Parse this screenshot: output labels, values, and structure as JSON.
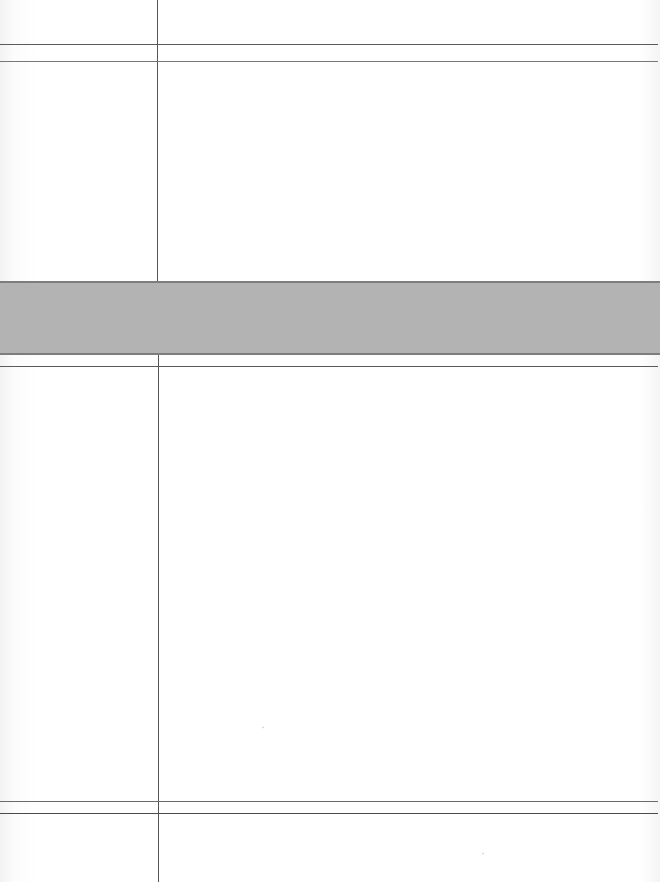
{
  "document": {
    "type": "blank ruled form page",
    "colors": {
      "paper": "#ffffff",
      "rule_lines": "#5a5a5a",
      "shaded_band": "#b3b3b3",
      "band_border": "#7d7d7d"
    },
    "sections": [
      {
        "id": "header-row",
        "left_label": "",
        "right_label": ""
      },
      {
        "id": "top-section",
        "left_text": "",
        "right_text": ""
      },
      {
        "id": "shaded-band",
        "text": ""
      },
      {
        "id": "middle-section",
        "left_text": "",
        "right_text": ""
      },
      {
        "id": "footer-row",
        "left_text": "",
        "right_text": ""
      }
    ]
  }
}
